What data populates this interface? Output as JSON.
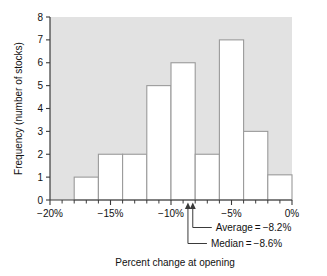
{
  "chart_data": {
    "type": "bar",
    "title": "",
    "xlabel": "Percent change at opening",
    "ylabel": "Frequency (number of stocks)",
    "xlim": [
      -20,
      0
    ],
    "ylim": [
      0,
      8
    ],
    "grid": false,
    "legend": "none",
    "bin_width": 2,
    "x_tick_labels": [
      "−20%",
      "−15%",
      "−10%",
      "−5%",
      "0%"
    ],
    "x_tick_values": [
      -20,
      -15,
      -10,
      -5,
      0
    ],
    "x_minor_tick_step": 1,
    "y_tick_labels": [
      "0",
      "1",
      "2",
      "3",
      "4",
      "5",
      "6",
      "7",
      "8"
    ],
    "y_tick_values": [
      0,
      1,
      2,
      3,
      4,
      5,
      6,
      7,
      8
    ],
    "bins": [
      {
        "start": -18,
        "end": -16,
        "value": 1
      },
      {
        "start": -16,
        "end": -14,
        "value": 2
      },
      {
        "start": -14,
        "end": -12,
        "value": 2
      },
      {
        "start": -12,
        "end": -10,
        "value": 5
      },
      {
        "start": -10,
        "end": -8,
        "value": 6
      },
      {
        "start": -8,
        "end": -6,
        "value": 2
      },
      {
        "start": -6,
        "end": -4,
        "value": 7
      },
      {
        "start": -4,
        "end": -2,
        "value": 3
      },
      {
        "start": -2,
        "end": 0,
        "value": 1.1
      }
    ],
    "categories": [
      "-18 to -16",
      "-16 to -14",
      "-14 to -12",
      "-12 to -10",
      "-10 to -8",
      "-8 to -6",
      "-6 to -4",
      "-4 to -2",
      "-2 to 0"
    ],
    "values": [
      1,
      2,
      2,
      5,
      6,
      2,
      7,
      3,
      1.1
    ],
    "annotations": [
      {
        "label": "Average = −8.2%",
        "x": -8.2,
        "name": "average"
      },
      {
        "label": "Median = −8.6%",
        "x": -8.6,
        "name": "median"
      }
    ],
    "colors": {
      "plot_background": "#e2e2e2",
      "bar_fill": "#ffffff",
      "bar_stroke": "#9a9a9a",
      "axis": "#3a3a3a",
      "text": "#111111",
      "page_background": "#ffffff"
    }
  }
}
